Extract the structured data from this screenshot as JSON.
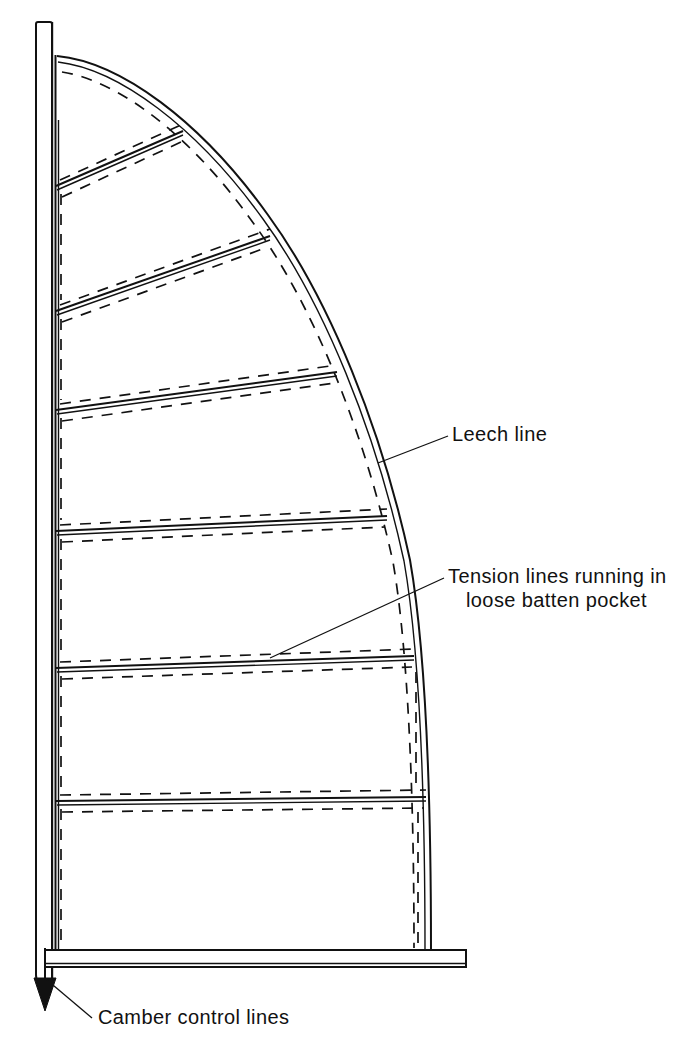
{
  "figure": {
    "kind": "technical-line-drawing",
    "background_color": "#ffffff",
    "line_color": "#111111"
  },
  "labels": [
    {
      "id": "leech-line",
      "text": "Leech line",
      "x": 452,
      "y": 441,
      "anchor": "start",
      "lines": [
        "Leech line"
      ]
    },
    {
      "id": "tension-lines",
      "text": "Tension lines running in loose batten pocket",
      "x": 448,
      "y": 583,
      "anchor": "start",
      "lines": [
        "Tension lines running in",
        "loose batten pocket"
      ],
      "line2_x": 466,
      "line2_y": 607
    },
    {
      "id": "camber-control-lines",
      "text": "Camber control lines",
      "x": 98,
      "y": 1024,
      "anchor": "start",
      "lines": [
        "Camber control lines"
      ]
    }
  ],
  "parts": {
    "mast": {
      "name": "mast",
      "top_y": 22,
      "bottom_y": 984,
      "left_x": 36,
      "right_x": 53,
      "description": "vertical spar at left edge with rounded foot"
    },
    "boom": {
      "name": "boom",
      "y_top": 950,
      "y_bottom": 967,
      "left_x": 45,
      "right_x": 466,
      "description": "horizontal spar at the foot of the sail"
    },
    "luff": {
      "name": "luff",
      "x": 55,
      "top_y": 55,
      "bottom_y": 950
    },
    "leech": {
      "name": "leech",
      "description": "curved trailing edge from head to clew, drawn as a double line with a dashed leech-line alongside",
      "head": {
        "x": 57,
        "y": 57
      },
      "clew": {
        "x": 430,
        "y": 950
      },
      "max_x": 432,
      "max_x_at_y": 860
    }
  },
  "battens": [
    {
      "index": 1,
      "luff_y": 186,
      "leech_x": 183,
      "leech_y": 131
    },
    {
      "index": 2,
      "luff_y": 311,
      "leech_x": 270,
      "leech_y": 236
    },
    {
      "index": 3,
      "luff_y": 410,
      "leech_x": 337,
      "leech_y": 372
    },
    {
      "index": 4,
      "luff_y": 531,
      "leech_x": 387,
      "leech_y": 516
    },
    {
      "index": 5,
      "luff_y": 668,
      "leech_x": 414,
      "leech_y": 656
    },
    {
      "index": 6,
      "luff_y": 801,
      "leech_x": 426,
      "leech_y": 797
    }
  ],
  "leaders": {
    "leech_line": {
      "from_x": 448,
      "from_y": 436,
      "to_x": 378,
      "to_y": 463
    },
    "tension_lines": {
      "from_x": 444,
      "from_y": 578,
      "via_x": 400,
      "via_y": 586,
      "to_x": 270,
      "to_y": 658
    },
    "camber_control_lines": {
      "from_x": 92,
      "from_y": 1018,
      "to_x": 47,
      "to_y": 980
    }
  },
  "camber_arrow": {
    "name": "camber-control-arrow",
    "shaft_x": 45,
    "shaft_top_y": 948,
    "shaft_bottom_y": 986,
    "head_tip_y": 1011,
    "head_half_width": 11,
    "direction": "down"
  }
}
